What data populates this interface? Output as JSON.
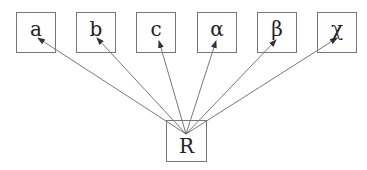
{
  "diagram": {
    "root": {
      "label": "R"
    },
    "nodes": [
      {
        "label": "a"
      },
      {
        "label": "b"
      },
      {
        "label": "c"
      },
      {
        "label": "α"
      },
      {
        "label": "β"
      },
      {
        "label": "χ"
      }
    ],
    "edges": [
      {
        "from": "R",
        "to": "a"
      },
      {
        "from": "R",
        "to": "b"
      },
      {
        "from": "R",
        "to": "c"
      },
      {
        "from": "R",
        "to": "α"
      },
      {
        "from": "R",
        "to": "β"
      },
      {
        "from": "R",
        "to": "χ"
      }
    ]
  }
}
